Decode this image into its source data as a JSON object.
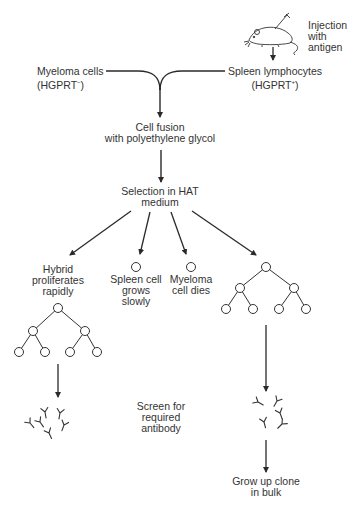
{
  "diagram": {
    "nodes": {
      "injection": {
        "lines": [
          "Injection",
          "with",
          "antigen"
        ]
      },
      "myeloma": {
        "lines": [
          "Myeloma cells",
          "(HGPRT"
        ],
        "sup": "−",
        "close": ")"
      },
      "spleen": {
        "lines": [
          "Spleen lymphocytes",
          "(HGPRT"
        ],
        "sup": "+",
        "close": ")"
      },
      "fusion": {
        "lines": [
          "Cell fusion",
          "with polyethylene glycol"
        ]
      },
      "selection": {
        "lines": [
          "Selection in HAT",
          "medium"
        ]
      },
      "hybrid": {
        "lines": [
          "Hybrid",
          "proliferates",
          "rapidly"
        ]
      },
      "spleen_cell": {
        "lines": [
          "Spleen cell",
          "grows",
          "slowly"
        ]
      },
      "myeloma_dies": {
        "lines": [
          "Myeloma",
          "cell dies"
        ]
      },
      "screen": {
        "lines": [
          "Screen for",
          "required",
          "antibody"
        ]
      },
      "grow": {
        "lines": [
          "Grow up clone",
          "in bulk"
        ]
      }
    },
    "icons": [
      "mouse-with-syringe-icon",
      "cell-circle-icon",
      "cell-division-tree-icon",
      "antibody-y-icon"
    ],
    "colors": {
      "line": "#2a2a2a",
      "background": "#ffffff"
    }
  }
}
